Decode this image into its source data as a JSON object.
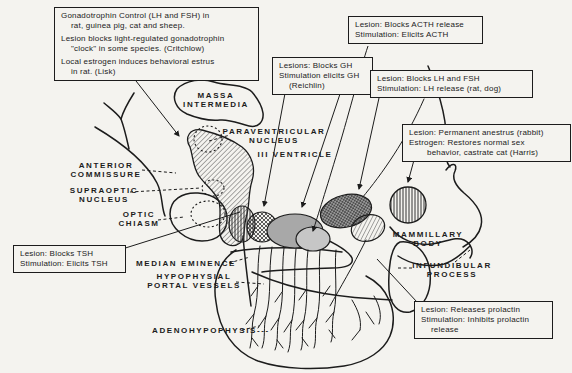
{
  "colors": {
    "paper": "#f4f3ef",
    "ink": "#1c1c1c",
    "nucleus_gray": "#a8a8a8",
    "nucleus_light_gray": "#c6c6c6",
    "nucleus_dark_gray": "#9a9a9a"
  },
  "callouts": [
    {
      "name": "gonadotrophin",
      "lines": [
        "Gonadotrophin Control (LH and FSH) in",
        "rat, guinea pig, cat and sheep.",
        "Lesion blocks light-regulated gonadotrophin",
        "\"clock\" in some species. (Critchlow)",
        "Local estrogen induces behavioral estrus",
        "in rat. (Lisk)"
      ]
    },
    {
      "name": "acth",
      "lines": [
        "Lesion: Blocks ACTH release",
        "Stimulation: Elicits ACTH"
      ]
    },
    {
      "name": "gh",
      "lines": [
        "Lesions: Blocks GH",
        "Stimulation elicits GH",
        "(Reichlin)"
      ]
    },
    {
      "name": "lh-fsh",
      "lines": [
        "Lesion: Blocks LH and FSH",
        "Stimulation: LH release (rat, dog)"
      ]
    },
    {
      "name": "anestrus",
      "lines": [
        "Lesion: Permanent anestrus (rabbit)",
        "Estrogen: Restores normal sex",
        "behavior, castrate cat (Harris)"
      ]
    },
    {
      "name": "tsh",
      "lines": [
        "Lesion: Blocks TSH",
        "Stimulation: Elicits TSH"
      ]
    },
    {
      "name": "prolactin",
      "lines": [
        "Lesion: Releases prolactin",
        "Stimulation: Inhibits prolactin",
        "release"
      ]
    }
  ],
  "labels": {
    "massa": "MASSA\nINTERMEDIA",
    "paraventricular": "PARAVENTRICULAR\nNUCLEUS",
    "ventricle": "III VENTRICLE",
    "commissure": "ANTERIOR\nCOMMISSURE",
    "supraoptic": "SUPRAOPTIC\nNUCLEUS",
    "optic": "OPTIC\nCHIASM",
    "median": "MEDIAN EMINENCE",
    "portal": "HYPOPHYSIAL\nPORTAL VESSELS",
    "adeno": "ADENOHYPOPHYSIS---",
    "mammillary": "MAMMILLARY\nBODY",
    "infundibular": "INFUNDIBULAR\nPROCESS"
  }
}
